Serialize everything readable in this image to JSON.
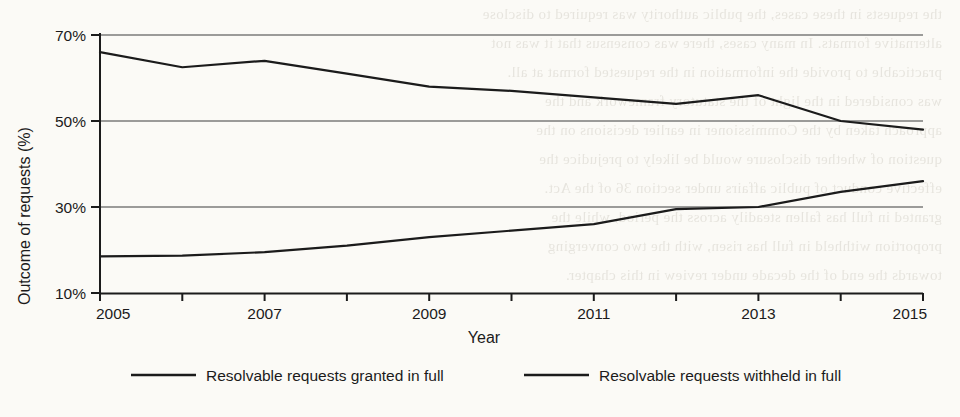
{
  "chart_data": {
    "type": "line",
    "title": "",
    "xlabel": "Year",
    "ylabel": "Outcome of requests (%)",
    "x": [
      2005,
      2006,
      2007,
      2008,
      2009,
      2010,
      2011,
      2012,
      2013,
      2014,
      2015
    ],
    "xtick_labels": [
      "2005",
      "2007",
      "2009",
      "2011",
      "2013",
      "2015"
    ],
    "xtick_values": [
      2005,
      2007,
      2009,
      2011,
      2013,
      2015
    ],
    "ytick_labels": [
      "10%",
      "30%",
      "50%",
      "70%"
    ],
    "ytick_values": [
      10,
      30,
      50,
      70
    ],
    "xlim": [
      2005,
      2015
    ],
    "ylim": [
      10,
      70
    ],
    "grid": "horizontal",
    "legend_position": "bottom",
    "line_color": "#1b1b1b",
    "grid_color": "#3d3d3d",
    "background_color": "#fbfaf6",
    "series": [
      {
        "name": "Resolvable requests granted in full",
        "values": [
          66,
          62.5,
          64,
          61,
          58,
          57,
          55.5,
          54,
          56,
          50,
          48
        ]
      },
      {
        "name": "Resolvable requests withheld in full",
        "values": [
          18.5,
          18.7,
          19.5,
          21,
          23,
          24.5,
          26,
          29.5,
          30,
          33.5,
          36
        ]
      }
    ]
  },
  "legend": {
    "items": [
      {
        "label": "Resolvable requests granted in full"
      },
      {
        "label": "Resolvable requests withheld in full"
      }
    ]
  },
  "bleed_text": {
    "lines": [
      "the requests in these cases, the public authority was required to disclose",
      "alternative formats. In many cases, there was consensus that it was not",
      "practicable to provide the information in the requested format at all.",
      "",
      "was considered in the light of the statutory framework and the",
      "approach taken by the Commissioner in earlier decisions on the",
      "question of whether disclosure would be likely to prejudice the",
      "effective conduct of public affairs under section 36 of the Act.",
      "",
      "granted in full has fallen steadily across the period, while the",
      "proportion withheld in full has risen, with the two converging",
      "towards the end of the decade under review in this chapter."
    ]
  }
}
